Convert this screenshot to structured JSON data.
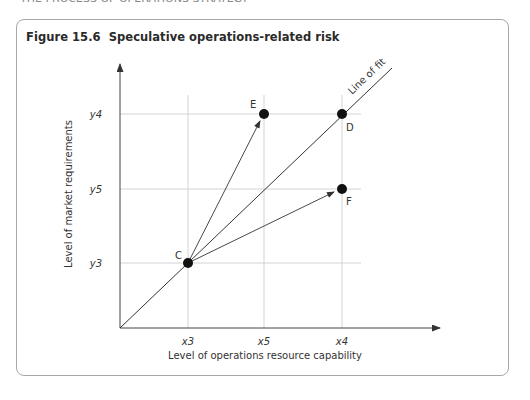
{
  "page": {
    "running_header": "THE PROCESS OF OPERATIONS STRATEGY"
  },
  "figure": {
    "title": "Figure 15.6  Speculative operations-related risk",
    "x_axis_label": "Level of operations resource capability",
    "y_axis_label": "Level of market requirements",
    "x_ticks": [
      "x3",
      "x5",
      "x4"
    ],
    "y_ticks": [
      "y3",
      "y5",
      "y4"
    ],
    "line_label": "Line of fit",
    "points": [
      {
        "name": "C",
        "x": "x3",
        "y": "y3"
      },
      {
        "name": "E",
        "x": "x5",
        "y": "y4"
      },
      {
        "name": "D",
        "x": "x4",
        "y": "y4"
      },
      {
        "name": "F",
        "x": "x4",
        "y": "y5"
      }
    ],
    "arrows": [
      {
        "from": "C",
        "to": "E"
      },
      {
        "from": "C",
        "to": "D"
      },
      {
        "from": "C",
        "to": "F"
      }
    ]
  }
}
